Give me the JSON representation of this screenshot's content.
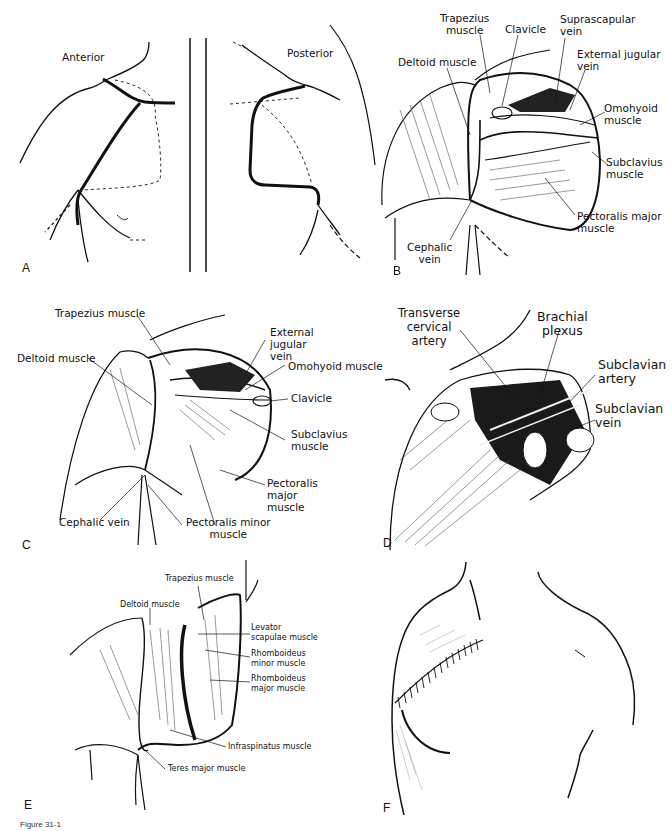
{
  "figure": {
    "caption_fragment": "Figure 31-1",
    "panels": [
      {
        "letter": "A",
        "labels": {
          "anterior": "Anterior",
          "posterior": "Posterior"
        }
      },
      {
        "letter": "B",
        "labels": {
          "trapezius": "Trapezius\nmuscle",
          "clavicle": "Clavicle",
          "suprascapular": "Suprascapular\nvein",
          "deltoid": "Deltoid muscle",
          "ext_jugular": "External jugular\nvein",
          "omohyoid": "Omohyoid\nmuscle",
          "subclavius": "Subclavius\nmuscle",
          "pectoralis_major": "Pectoralis major\nmuscle",
          "cephalic": "Cephalic\nvein"
        }
      },
      {
        "letter": "C",
        "labels": {
          "trapezius": "Trapezius muscle",
          "deltoid": "Deltoid muscle",
          "ext_jugular": "External jugular\nvein",
          "omohyoid": "Omohyoid muscle",
          "clavicle": "Clavicle",
          "subclavius": "Subclavius\nmuscle",
          "pectoralis_major": "Pectoralis major\nmuscle",
          "cephalic": "Cephalic vein",
          "pectoralis_minor": "Pectoralis minor\nmuscle"
        }
      },
      {
        "letter": "D",
        "labels": {
          "transverse_cervical": "Transverse\ncervical\nartery",
          "brachial_plexus": "Brachial\nplexus",
          "subclavian_artery": "Subclavian\nartery",
          "subclavian_vein": "Subclavian\nvein"
        }
      },
      {
        "letter": "E",
        "labels": {
          "trapezius": "Trapezius muscle",
          "deltoid": "Deltoid muscle",
          "levator": "Levator\nscapulae muscle",
          "rhomboid_minor": "Rhomboideus\nminor muscle",
          "rhomboid_major": "Rhomboideus\nmajor muscle",
          "infraspinatus": "Infraspinatus muscle",
          "teres_major": "Teres major muscle"
        }
      },
      {
        "letter": "F",
        "labels": {}
      }
    ]
  }
}
